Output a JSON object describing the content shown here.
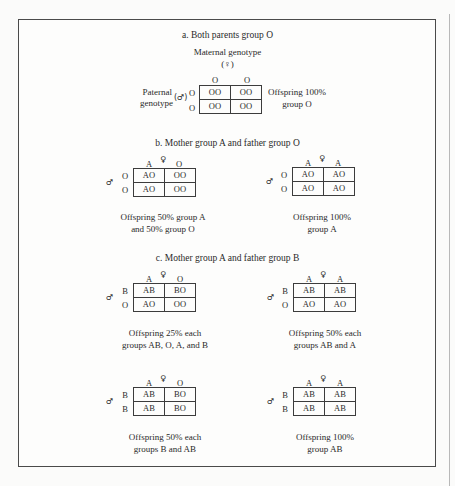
{
  "sections": {
    "a": {
      "title": "a.  Both parents group O",
      "maternal_label": "Maternal genotype",
      "maternal_symbol": "(♀)",
      "paternal_label_line1": "Paternal",
      "paternal_label_line2": "genotype",
      "paternal_symbol": "(♂)",
      "col_alleles": [
        "O",
        "O"
      ],
      "row_alleles": [
        "O",
        "O"
      ],
      "cells": [
        [
          "OO",
          "OO"
        ],
        [
          "OO",
          "OO"
        ]
      ],
      "result_line1": "Offspring 100%",
      "result_line2": "group O"
    },
    "b": {
      "title": "b.  Mother group A and father group O",
      "squares": [
        {
          "female_symbol": "♀",
          "male_symbol": "♂",
          "col_alleles": [
            "A",
            "O"
          ],
          "row_alleles": [
            "O",
            "O"
          ],
          "cells": [
            [
              "AO",
              "OO"
            ],
            [
              "AO",
              "OO"
            ]
          ],
          "result_line1": "Offspring 50% group A",
          "result_line2": "and 50% group O"
        },
        {
          "female_symbol": "♀",
          "male_symbol": "♂",
          "col_alleles": [
            "A",
            "A"
          ],
          "row_alleles": [
            "O",
            "O"
          ],
          "cells": [
            [
              "AO",
              "AO"
            ],
            [
              "AO",
              "AO"
            ]
          ],
          "result_line1": "Offspring 100%",
          "result_line2": "group A"
        }
      ]
    },
    "c": {
      "title": "c.  Mother group A and father group B",
      "squares": [
        {
          "female_symbol": "♀",
          "male_symbol": "♂",
          "col_alleles": [
            "A",
            "O"
          ],
          "row_alleles": [
            "B",
            "O"
          ],
          "cells": [
            [
              "AB",
              "BO"
            ],
            [
              "AO",
              "OO"
            ]
          ],
          "result_line1": "Offspring 25% each",
          "result_line2": "groups AB, O, A, and B"
        },
        {
          "female_symbol": "♀",
          "male_symbol": "♂",
          "col_alleles": [
            "A",
            "A"
          ],
          "row_alleles": [
            "B",
            "O"
          ],
          "cells": [
            [
              "AB",
              "AB"
            ],
            [
              "AO",
              "AO"
            ]
          ],
          "result_line1": "Offspring 50% each",
          "result_line2": "groups AB and A"
        },
        {
          "female_symbol": "♀",
          "male_symbol": "♂",
          "col_alleles": [
            "A",
            "O"
          ],
          "row_alleles": [
            "B",
            "B"
          ],
          "cells": [
            [
              "AB",
              "BO"
            ],
            [
              "AB",
              "BO"
            ]
          ],
          "result_line1": "Offspring 50% each",
          "result_line2": "groups B and AB"
        },
        {
          "female_symbol": "♀",
          "male_symbol": "♂",
          "col_alleles": [
            "A",
            "A"
          ],
          "row_alleles": [
            "B",
            "B"
          ],
          "cells": [
            [
              "AB",
              "AB"
            ],
            [
              "AB",
              "AB"
            ]
          ],
          "result_line1": "Offspring 100%",
          "result_line2": "group AB"
        }
      ]
    }
  }
}
